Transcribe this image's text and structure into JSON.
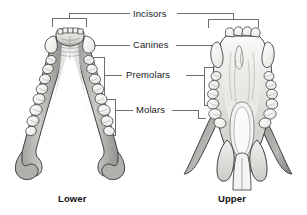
{
  "diagram": {
    "labels": {
      "incisors": "Incisors",
      "canines": "Canines",
      "premolars": "Premolars",
      "molars": "Molars"
    },
    "views": {
      "lower": "Lower",
      "upper": "Upper"
    },
    "colors": {
      "line": "#6e6e6e",
      "outline": "#3a3a3a",
      "text": "#1a1a1a",
      "bone_light": "#f2f2f0",
      "bone_mid": "#d9d9d6",
      "bone_dark": "#9a9a98",
      "tooth": "#fbfbfa",
      "background": "#ffffff"
    }
  }
}
